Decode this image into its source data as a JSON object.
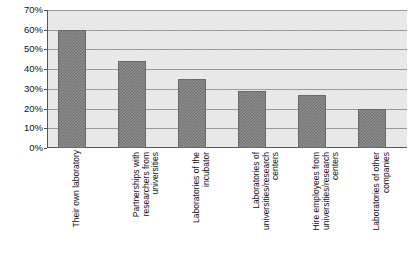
{
  "chart_data": {
    "type": "bar",
    "title": "",
    "xlabel": "",
    "ylabel": "",
    "ylim": [
      0,
      70
    ],
    "grid": true,
    "legend": "none",
    "y_tick_labels": [
      "70%",
      "60%",
      "50%",
      "40%",
      "30%",
      "20%",
      "10%",
      "0%"
    ],
    "y_tick_values": [
      70,
      60,
      50,
      40,
      30,
      20,
      10,
      0
    ],
    "categories": [
      "Their own laboratory",
      "Partnerships with researchers from universities",
      "Laboratories of the incubator",
      "Laboratories of universities/research centers",
      "Hire employees from universities/research centers",
      "Laboratories of other companies"
    ],
    "values": [
      60,
      44,
      35,
      29,
      27,
      20
    ],
    "value_labels": [
      "60%",
      "44%",
      "35%",
      "29%",
      "27%",
      "20%"
    ],
    "colors": {
      "bar_fill": "#8d8d8d",
      "bar_edge": "#6a6a6a",
      "plot_background": "#ececec",
      "gridline": "#9a9a9a",
      "axis": "#555555",
      "text": "#111111"
    }
  }
}
